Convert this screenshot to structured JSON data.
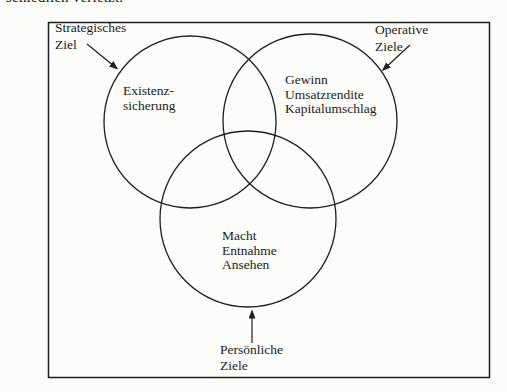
{
  "page": {
    "top_cut_text": "schiedlich verletzt."
  },
  "diagram": {
    "callouts": {
      "strategic": {
        "label": "Strategisches\nZiel"
      },
      "operative": {
        "label": "Operative\nZiele"
      },
      "personal": {
        "label": "Persönliche\nZiele"
      }
    },
    "circles": {
      "strategic": {
        "text": "Existenz-\nsicherung"
      },
      "operative": {
        "text": "Gewinn\nUmsatzrendite\nKapitalumschlag"
      },
      "personal": {
        "text": "Macht\nEntnahme\nAnsehen"
      }
    },
    "colors": {
      "line": "#1e1e1e",
      "text": "#1b1b1b",
      "background": "#fcfcfa"
    }
  }
}
